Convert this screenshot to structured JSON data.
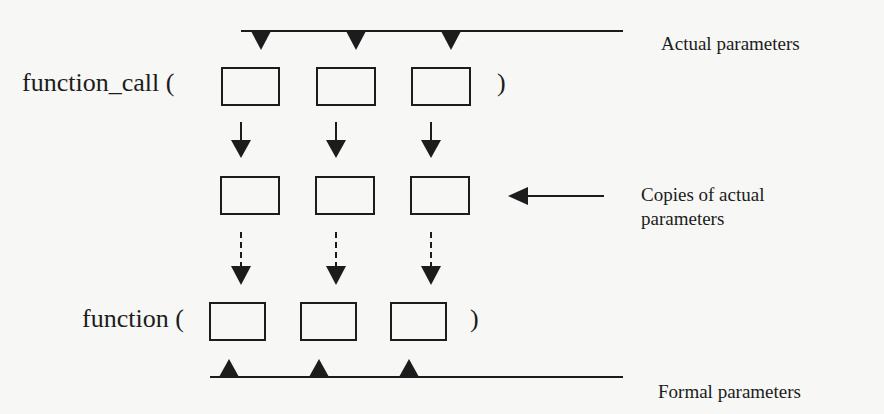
{
  "diagram": {
    "type": "parameter-passing-by-value",
    "labels": {
      "function_call": "function_call (",
      "function_call_close": ")",
      "function": "function (",
      "function_close": ")",
      "actual_parameters": "Actual parameters",
      "copies_line1": "Copies of actual",
      "copies_line2": "parameters",
      "formal_parameters": "Formal parameters"
    },
    "rows": [
      {
        "name": "actual-parameter-slots",
        "box_count": 3
      },
      {
        "name": "copied-parameter-slots",
        "box_count": 3
      },
      {
        "name": "formal-parameter-slots",
        "box_count": 3
      }
    ],
    "connectors": {
      "actual_to_copies": "solid-arrow-down",
      "copies_to_formal": "dashed-arrow-down",
      "copies_pointer": "arrow-left"
    },
    "colors": {
      "background": "#f7f7f5",
      "ink": "#1c1c1c"
    }
  }
}
